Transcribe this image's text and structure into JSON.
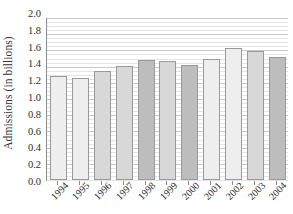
{
  "chart_data": {
    "type": "bar",
    "title": "",
    "xlabel": "",
    "ylabel": "Admissions (in billions)",
    "categories": [
      "1994",
      "1995",
      "1996",
      "1997",
      "1998",
      "1999",
      "2000",
      "2001",
      "2002",
      "2003",
      "2004"
    ],
    "values": [
      1.29,
      1.26,
      1.34,
      1.41,
      1.48,
      1.47,
      1.42,
      1.49,
      1.63,
      1.59,
      1.52
    ],
    "ylim": [
      0.0,
      2.0
    ],
    "ytick_labels": [
      "2.0",
      "1.8",
      "1.6",
      "1.4",
      "1.2",
      "1.0",
      "0.8",
      "0.6",
      "0.4",
      "0.2",
      "0.0"
    ],
    "ytick_values": [
      2.0,
      1.8,
      1.6,
      1.4,
      1.2,
      1.0,
      0.8,
      0.6,
      0.4,
      0.2,
      0.0
    ],
    "ytick_step": 0.2,
    "minor_tick_step": 0.05,
    "grid": true,
    "grid_axis": "y",
    "legend": false,
    "legend_position": "none",
    "bar_shades": [
      "light",
      "light",
      "medium",
      "medium",
      "dark",
      "medium",
      "dark",
      "light",
      "light",
      "medium",
      "dark"
    ],
    "colors": {
      "bar_light": "#eeeeee",
      "bar_medium": "#d8d8d8",
      "bar_dark": "#bdbdbd",
      "bar_edge": "#9a9a9a",
      "axis": "#8d8d8d",
      "gridline_major": "#c9c9c9",
      "gridline_minor": "#e4e4e4",
      "text": "#2e2e2e",
      "background": "#ffffff"
    }
  }
}
